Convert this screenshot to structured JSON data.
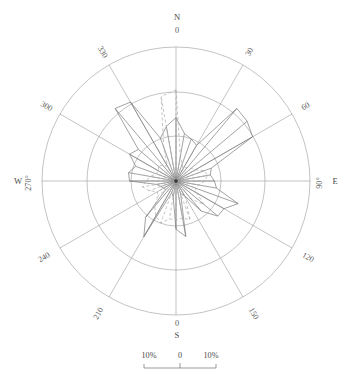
{
  "chart_data": {
    "type": "line",
    "subtype": "wind-rose-polar",
    "title": "",
    "xlabel": "",
    "ylabel": "",
    "grid": true,
    "legend_position": "none",
    "center": {
      "x": 176,
      "y": 181
    },
    "radial_axis": {
      "unit": "%",
      "rmin": 0,
      "rmax": 15,
      "ring_values": [
        5,
        10,
        15
      ],
      "ring_radii_px": [
        45,
        89,
        134
      ]
    },
    "angular_axis": {
      "unit": "degrees",
      "zero_at": "north",
      "direction": "clockwise",
      "tick_step": 30,
      "ticks": [
        0,
        30,
        60,
        90,
        120,
        150,
        180,
        210,
        240,
        270,
        300,
        330
      ]
    },
    "axis_labels": {
      "north_letter": "N",
      "north_degrees": "0",
      "south_letter": "S",
      "south_degrees": "0",
      "west_letter": "W",
      "west_degrees": "270°",
      "east_letter": "E",
      "east_degrees": "90°",
      "deg_30": "30",
      "deg_60": "60",
      "deg_120": "120",
      "deg_150": "150",
      "deg_210": "210",
      "deg_240": "240",
      "deg_300": "300",
      "deg_330": "330"
    },
    "scale_bar": {
      "left_label": "10%",
      "center_label": "0",
      "right_label": "10%"
    },
    "series": [
      {
        "name": "series-solid",
        "style": "solid",
        "color": "#7b7b7b",
        "angles": [
          0,
          10,
          20,
          30,
          40,
          50,
          60,
          70,
          80,
          90,
          100,
          110,
          120,
          130,
          140,
          150,
          160,
          170,
          180,
          190,
          200,
          210,
          220,
          230,
          240,
          250,
          260,
          270,
          280,
          290,
          300,
          310,
          320,
          330,
          340,
          350
        ],
        "values": [
          7.1,
          5.4,
          5.0,
          4.6,
          10.6,
          10.4,
          9.9,
          4.2,
          3.9,
          4.3,
          4.6,
          7.4,
          6.2,
          6.1,
          4.4,
          1.9,
          1.5,
          6.3,
          5.4,
          1.8,
          1.4,
          7.2,
          5.3,
          1.5,
          1.6,
          1.8,
          2.2,
          5.2,
          5.4,
          4.8,
          6.0,
          5.5,
          10.6,
          10.2,
          5.1,
          6.2
        ]
      },
      {
        "name": "series-dashed",
        "style": "dashed",
        "color": "#a9a9a9",
        "angles": [
          0,
          10,
          20,
          30,
          40,
          50,
          60,
          70,
          80,
          90,
          100,
          110,
          120,
          130,
          140,
          150,
          160,
          170,
          180,
          190,
          200,
          210,
          220,
          230,
          240,
          250,
          260,
          270,
          280,
          290,
          300,
          310,
          320,
          330,
          340,
          350
        ],
        "values": [
          10.2,
          2.8,
          2.0,
          1.6,
          2.0,
          2.2,
          2.5,
          3.4,
          3.6,
          3.2,
          2.6,
          2.3,
          2.7,
          4.1,
          2.6,
          2.1,
          4.6,
          4.2,
          4.4,
          4.3,
          5.0,
          4.5,
          3.7,
          2.7,
          2.4,
          3.2,
          3.8,
          3.4,
          2.9,
          2.4,
          2.2,
          2.6,
          2.3,
          1.9,
          4.0,
          9.6
        ]
      }
    ]
  }
}
